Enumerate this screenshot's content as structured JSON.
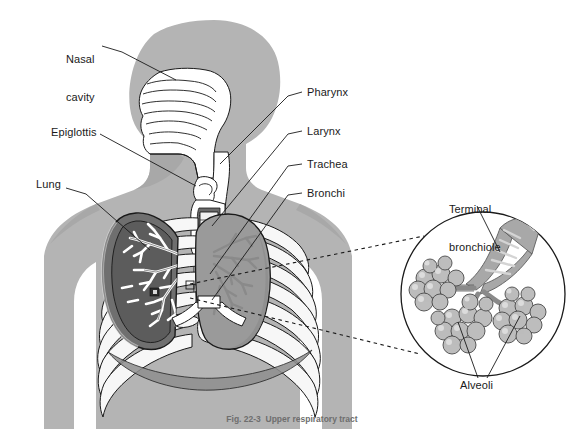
{
  "figure": {
    "caption": "Fig. 22-3  Upper respiratory tract",
    "background_color": "#ffffff",
    "body_silhouette_color": "#b4b4b4",
    "body_silhouette_shadow_color": "#a0a0a0",
    "line_color": "#1a1a1a",
    "airway_fill_color": "#ffffff",
    "lung_left_fill_color": "#6f6f6f",
    "lung_right_fill_color": "#9a9a9a",
    "bone_fill_color": "#f2f2f2",
    "alveoli_fill_color": "#b9b9b9",
    "bronchiole_fill_color": "#a8a8a8",
    "text_color": "#1a1a1a"
  },
  "labels": {
    "nasal_cavity": {
      "line1": "Nasal",
      "line2": "cavity",
      "x": 66,
      "y": 28
    },
    "epiglottis": {
      "text": "Epiglottis",
      "x": 51,
      "y": 131
    },
    "lung": {
      "text": "Lung",
      "x": 36,
      "y": 183
    },
    "pharynx": {
      "text": "Pharynx",
      "x": 307,
      "y": 89
    },
    "larynx": {
      "text": "Larynx",
      "x": 307,
      "y": 128
    },
    "trachea": {
      "text": "Trachea",
      "x": 307,
      "y": 161
    },
    "bronchi": {
      "text": "Bronchi",
      "x": 307,
      "y": 190
    },
    "terminal_bronchiole": {
      "line1": "Terminal",
      "line2": "bronchiole",
      "x": 449,
      "y": 180
    },
    "alveoli": {
      "text": "Alveoli",
      "x": 460,
      "y": 382
    }
  },
  "inset": {
    "name": "alveoli-magnification-circle",
    "center_x": 483,
    "center_y": 294,
    "radius": 82
  },
  "structures": [
    "nasal cavity",
    "pharynx",
    "epiglottis",
    "larynx",
    "trachea",
    "bronchi",
    "lung",
    "terminal bronchiole",
    "alveoli",
    "rib cage",
    "diaphragm",
    "vertebral column"
  ]
}
